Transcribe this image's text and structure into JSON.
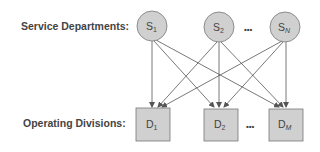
{
  "labels": {
    "service": "Service Departments:",
    "operating": "Operating Divisions:"
  },
  "service_nodes": [
    {
      "main": "S",
      "sub": "1"
    },
    {
      "main": "S",
      "sub": "2"
    },
    {
      "main": "S",
      "sub": "N"
    }
  ],
  "division_nodes": [
    {
      "main": "D",
      "sub": "1"
    },
    {
      "main": "D",
      "sub": "2"
    },
    {
      "main": "D",
      "sub": "M"
    }
  ],
  "ellipsis": "•••",
  "colors": {
    "node_fill": "#d0d0d0",
    "node_stroke": "#777777",
    "edge": "#555555",
    "text": "#444444"
  }
}
